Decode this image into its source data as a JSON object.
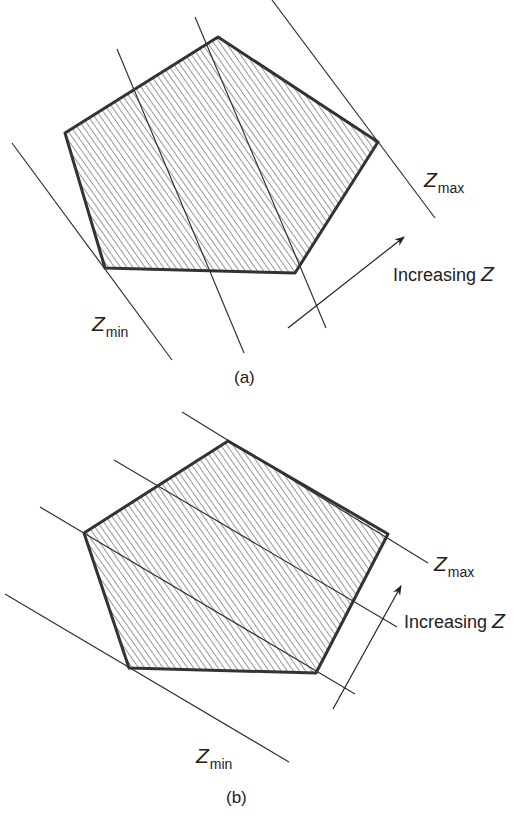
{
  "panels": [
    {
      "id": "a",
      "caption": "(a)",
      "zmax_label": {
        "symbol": "Z",
        "subscript": "max"
      },
      "zmin_label": {
        "symbol": "Z",
        "subscript": "min"
      },
      "arrow_label": {
        "text": "Increasing ",
        "symbol": "Z"
      }
    },
    {
      "id": "b",
      "caption": "(b)",
      "zmax_label": {
        "symbol": "Z",
        "subscript": "max"
      },
      "zmin_label": {
        "symbol": "Z",
        "subscript": "min"
      },
      "arrow_label": {
        "text": "Increasing ",
        "symbol": "Z"
      }
    }
  ],
  "colors": {
    "stroke": "#333333",
    "hatch": "#444444",
    "background": "#ffffff"
  }
}
